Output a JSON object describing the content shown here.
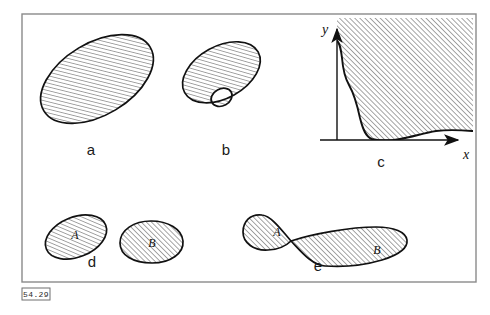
{
  "figure": {
    "number_label": "54.29",
    "frame": {
      "x": 22,
      "y": 14,
      "width": 454,
      "height": 268,
      "color": "#8a8a8a"
    },
    "background_color": "#ffffff",
    "ink_color": "#111111",
    "hatch": {
      "angle_degrees": 45,
      "spacing_px": 3.6,
      "line_width_px": 0.75,
      "color": "#111111",
      "direction": "lower-left to upper-right"
    }
  },
  "panels": [
    {
      "id": "a",
      "label": "a",
      "label_position": {
        "x": 91,
        "y": 155
      },
      "shape": "filled-ellipse",
      "description": "Single hatched simply-connected region (ellipse rotated about -30 degrees)",
      "region_labels": []
    },
    {
      "id": "b",
      "label": "b",
      "label_position": {
        "x": 226,
        "y": 155
      },
      "shape": "annulus",
      "description": "Hatched ellipse containing one elliptical hole (doubly-connected region)",
      "region_labels": []
    },
    {
      "id": "c",
      "label": "c",
      "label_position": {
        "x": 381,
        "y": 166
      },
      "shape": "curve-bounded-region",
      "description": "Hatched region in the first quadrant bounded below-left by a steeply descending curve",
      "axes": {
        "x_label": "x",
        "y_label": "y",
        "x_label_position": {
          "x": 466,
          "y": 158
        },
        "y_label_position": {
          "x": 325,
          "y": 32
        },
        "origin": {
          "x": 337,
          "y": 140
        },
        "x_arrow_end": {
          "x": 461,
          "y": 140
        },
        "y_arrow_end": {
          "x": 337,
          "y": 26
        }
      },
      "region_labels": []
    },
    {
      "id": "d",
      "label": "d",
      "label_position": {
        "x": 92,
        "y": 266
      },
      "shape": "two-disjoint-regions",
      "description": "Two separate hatched blobs that do not touch (disconnected region)",
      "region_labels": [
        {
          "text": "A",
          "x": 75,
          "y": 236
        },
        {
          "text": "B",
          "x": 140,
          "y": 243
        }
      ]
    },
    {
      "id": "e",
      "label": "e",
      "label_position": {
        "x": 318,
        "y": 270
      },
      "shape": "bowtie",
      "description": "Two hatched lobes meeting at a single pinch point (figure-eight)",
      "region_labels": [
        {
          "text": "A",
          "x": 277,
          "y": 234
        },
        {
          "text": "B",
          "x": 377,
          "y": 253
        }
      ]
    }
  ]
}
